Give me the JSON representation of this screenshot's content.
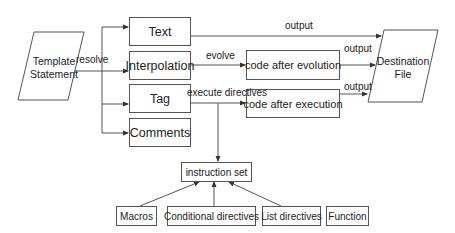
{
  "diagram": {
    "source": {
      "line1": "Template",
      "line2": "Statement"
    },
    "destination": {
      "line1": "Destination",
      "line2": "File"
    },
    "categories": [
      {
        "id": "text",
        "label": "Text"
      },
      {
        "id": "interpolation",
        "label": "Interpolation"
      },
      {
        "id": "tag",
        "label": "Tag"
      },
      {
        "id": "comments",
        "label": "Comments"
      }
    ],
    "intermediate": {
      "evolution": "code after evolution",
      "execution": "code after execution"
    },
    "instruction_set": "instruction set",
    "instructions": [
      {
        "id": "macros",
        "label": "Macros"
      },
      {
        "id": "conditional",
        "label": "Conditional directives"
      },
      {
        "id": "list",
        "label": "List directives"
      },
      {
        "id": "function",
        "label": "Function"
      }
    ],
    "edge_labels": {
      "resolve": "resolve",
      "output_text": "output",
      "evolve": "evolve",
      "output_evolution": "output",
      "execute": "execute directives",
      "output_execution": "output"
    },
    "colors": {
      "stroke": "#555555",
      "text": "#222222",
      "background": "#ffffff"
    }
  }
}
